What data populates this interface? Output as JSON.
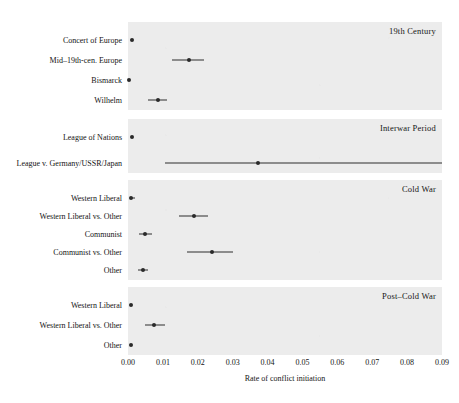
{
  "chart_data": {
    "type": "scatter",
    "title": "",
    "xlabel": "Rate of conflict initiation",
    "ylabel": "",
    "xlim": [
      0.0,
      0.09
    ],
    "xticks": [
      0.0,
      0.01,
      0.02,
      0.03,
      0.04,
      0.05,
      0.06,
      0.07,
      0.08,
      0.09
    ],
    "xticklabels": [
      "0.00",
      "0.01",
      "0.02",
      "0.03",
      "0.04",
      "0.05",
      "0.06",
      "0.07",
      "0.08",
      "0.09"
    ],
    "grid": false,
    "legend": "none",
    "panel_layout": "4 stacked horizontal panels, shared x-axis",
    "marker": "filled circle with horizontal confidence interval whisker",
    "panels": [
      {
        "title": "19th Century",
        "rows": [
          {
            "label": "Concert of Europe",
            "estimate": 0.0012,
            "low": 0.0012,
            "high": 0.0012
          },
          {
            "label": "Mid–19th-cen. Europe",
            "estimate": 0.0175,
            "low": 0.0127,
            "high": 0.0218
          },
          {
            "label": "Bismarck",
            "estimate": 0.0002,
            "low": 0.0002,
            "high": 0.0002
          },
          {
            "label": "Wilhelm",
            "estimate": 0.0085,
            "low": 0.0058,
            "high": 0.0112
          }
        ]
      },
      {
        "title": "Interwar Period",
        "rows": [
          {
            "label": "League of Nations",
            "estimate": 0.0012,
            "low": 0.0012,
            "high": 0.0012
          },
          {
            "label": "League v. Germany/USSR/Japan",
            "estimate": 0.0372,
            "low": 0.0105,
            "high": 0.09
          }
        ]
      },
      {
        "title": "Cold War",
        "rows": [
          {
            "label": "Western Liberal",
            "estimate": 0.001,
            "low": 0.0007,
            "high": 0.002
          },
          {
            "label": "Western Liberal vs. Other",
            "estimate": 0.019,
            "low": 0.0145,
            "high": 0.0228
          },
          {
            "label": "Communist",
            "estimate": 0.005,
            "low": 0.0032,
            "high": 0.0068
          },
          {
            "label": "Communist vs. Other",
            "estimate": 0.024,
            "low": 0.017,
            "high": 0.03
          },
          {
            "label": "Other",
            "estimate": 0.0043,
            "low": 0.0028,
            "high": 0.0058
          }
        ]
      },
      {
        "title": "Post–Cold War",
        "rows": [
          {
            "label": "Western Liberal",
            "estimate": 0.0008,
            "low": 0.0008,
            "high": 0.0008
          },
          {
            "label": "Western Liberal vs. Other",
            "estimate": 0.0075,
            "low": 0.0048,
            "high": 0.0105
          },
          {
            "label": "Other",
            "estimate": 0.001,
            "low": 0.001,
            "high": 0.001
          }
        ]
      }
    ]
  },
  "style": {
    "panel_background": "#ececec",
    "page_background": "#ffffff",
    "marker_color": "#2a2a2a",
    "text_color": "#151515"
  }
}
